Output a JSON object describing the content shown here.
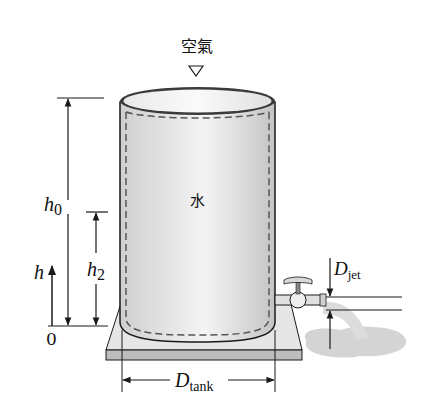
{
  "diagram": {
    "air_label": "空氣",
    "water_label": "水",
    "h0": {
      "main": "h",
      "sub": "0"
    },
    "h2": {
      "main": "h",
      "sub": "2"
    },
    "h": {
      "main": "h"
    },
    "zero": "0",
    "d_jet": {
      "main": "D",
      "sub": "jet"
    },
    "d_tank": {
      "main": "D",
      "sub": "tank"
    }
  },
  "colors": {
    "stroke": "#1a1a1a",
    "tank_fill": "#d9d9d9",
    "tank_highlight": "#f4f4f4",
    "base_top": "#e6e6e6",
    "base_front": "#bdbdbd",
    "puddle": "#d4d4d4",
    "dash": "#555555"
  }
}
